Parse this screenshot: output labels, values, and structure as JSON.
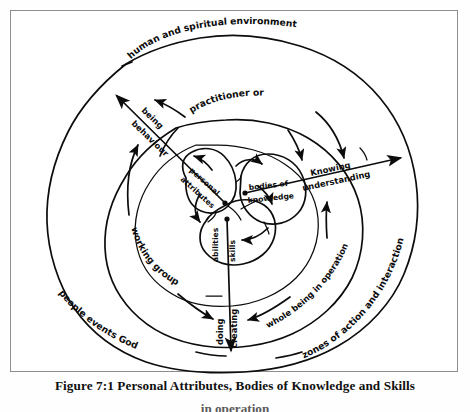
{
  "figure": {
    "caption_line1": "Figure 7:1  Personal Attributes, Bodies of Knowledge and Skills",
    "caption_line2": "in operation",
    "border_color": "#8d8d8d",
    "ink_color": "#0c0c0c",
    "background": "#ffffff"
  },
  "diagram": {
    "type": "concentric-zones-diagram",
    "title": "Personal Attributes, Bodies of Knowledge and Skills",
    "rings": [
      {
        "id": "ring-outer",
        "label_top": "human and spiritual environment",
        "label_bottom_left": "people  events   God",
        "label_bottom_right": "zones of action and interaction"
      },
      {
        "id": "ring-second",
        "label_top": "practitioner or",
        "label_bottom_right": "whole being in operation"
      },
      {
        "id": "ring-third",
        "label_bottom_left": "working group"
      }
    ],
    "core_blobs": [
      {
        "id": "blob-personal-attributes",
        "label": "personal\nattributes",
        "line1": "personal",
        "line2": "attributes"
      },
      {
        "id": "blob-bodies-of-knowledge",
        "label": "bodies of\nknowledge",
        "line1": "bodies of",
        "line2": "knowledge"
      },
      {
        "id": "blob-abilities-skills",
        "label": "abilities skills",
        "line1": "abilities",
        "line2": "skills"
      }
    ],
    "axes": [
      {
        "id": "axis-being-behaviour",
        "line1": "being",
        "line2": "behaviour",
        "direction": "up-left"
      },
      {
        "id": "axis-knowing-understanding",
        "line1": "Knowing",
        "line2": "understanding",
        "direction": "up-right"
      },
      {
        "id": "axis-doing-creating",
        "line1": "doing",
        "line2": "creating",
        "direction": "down"
      }
    ]
  }
}
